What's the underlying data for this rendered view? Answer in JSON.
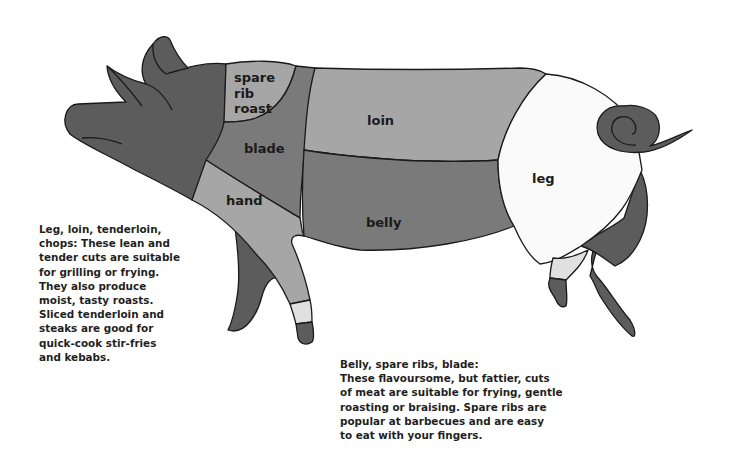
{
  "diagram": {
    "cuts": [
      {
        "id": "spare_rib_roast",
        "label_lines": [
          "spare",
          "rib",
          "roast"
        ],
        "color": "#a6a6a6"
      },
      {
        "id": "blade",
        "label_lines": [
          "blade"
        ],
        "color": "#7a7a7a"
      },
      {
        "id": "hand",
        "label_lines": [
          "hand"
        ],
        "color": "#a6a6a6"
      },
      {
        "id": "loin",
        "label_lines": [
          "loin"
        ],
        "color": "#a6a6a6"
      },
      {
        "id": "belly",
        "label_lines": [
          "belly"
        ],
        "color": "#7a7a7a"
      },
      {
        "id": "leg",
        "label_lines": [
          "leg"
        ],
        "color": "#fafafa"
      },
      {
        "id": "head",
        "label_lines": [],
        "color": "#5c5c5c"
      },
      {
        "id": "trotters",
        "label_lines": [],
        "color": "#5c5c5c"
      }
    ],
    "outline_color": "#1a1a1a"
  },
  "captions": {
    "left": {
      "lines": [
        "Leg, loin, tenderloin,",
        "chops: These lean and",
        "tender cuts are suitable",
        "for grilling or frying.",
        "They also produce",
        "moist, tasty roasts.",
        "Sliced tenderloin and",
        "steaks are good for",
        "quick-cook stir-fries",
        "and kebabs."
      ]
    },
    "right": {
      "lines": [
        "Belly, spare ribs, blade:",
        "These flavoursome, but fattier, cuts",
        "of meat are suitable for frying, gentle",
        "roasting or braising. Spare ribs are",
        "popular at barbecues and are easy",
        "to eat with your fingers."
      ]
    }
  }
}
